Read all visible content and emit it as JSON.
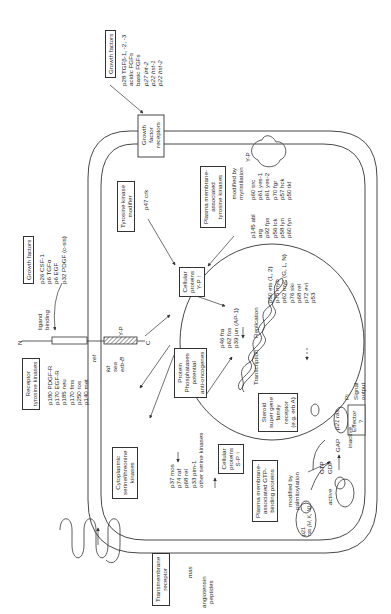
{
  "diagram": {
    "orientation": "rotated-90-ccw",
    "growth_factors_top": {
      "title": "Growth factors",
      "items": [
        "p28 TGFβ-1, -2, -3",
        "acidic FGFs",
        "basic FGFs",
        "p27 int-2",
        "p22 hst-1",
        "p22 hst-2"
      ]
    },
    "growth_factor_receptors": {
      "label_lines": [
        "Growth",
        "factor",
        "receptors"
      ]
    },
    "tyrosine_kinase_modifier": {
      "label_lines": [
        "Tyrosine kinase",
        "modifier"
      ],
      "item": "p47 crk"
    },
    "pm_tyrosine_kinases": {
      "label_lines": [
        "Plasma membrane-",
        "associated",
        "tyrosine kinases"
      ],
      "note_lines": [
        "modified by",
        "myristilation"
      ],
      "col1": [
        "p145 abl",
        "arg",
        "",
        "p92 fps",
        "p56 lck",
        "p58 lyn",
        "p60 fyn"
      ],
      "col2": [
        "p60 src",
        "p61 yes-1",
        "p61 yes-2",
        "p70 fgr",
        "p57 hck",
        "p50 tkl"
      ],
      "phospho": "Y-P"
    },
    "growth_factors_left": {
      "title": "Growth factors",
      "binding_lines": [
        "ligand",
        "binding"
      ],
      "items": [
        "p26 CSF-1",
        "p6 TGFα",
        "p6 EGF",
        "p32 PDGF (c-sis)"
      ]
    },
    "receptor_tyrosine_kinases": {
      "label_lines": [
        "Receptor",
        "tyrosine kinases"
      ],
      "items": [
        "p180 PDGF-R",
        "p170 EGF-R",
        "p185 neu",
        "p170 fms",
        "p250 ros",
        "p140 met"
      ],
      "extra_top": "ret",
      "extra": [
        "kit",
        "sea",
        "erb-B"
      ],
      "n_term": "N",
      "c_term": "C",
      "phospho": "Y-P"
    },
    "cellular_proteins_y": {
      "label_lines": [
        "Cellular",
        "proteins",
        "Y-P ↑"
      ]
    },
    "protein_phosphatases": {
      "label_lines": [
        "Protein",
        "Phosphatases",
        "potential",
        "anti-oncogenes"
      ]
    },
    "nucleus": {
      "ap1": [
        "p46 fra",
        "p62 fos",
        "p39 jun (AP-1)"
      ],
      "transcription": "Transcription",
      "replication": "Replication",
      "nuclear_oncogenes": [
        "p50 ets (1, 2)",
        "p75 myb",
        "p62 myc (G, L, N)",
        "p76 ski",
        "p68 rel",
        "p72 evi",
        "p53"
      ],
      "steroid_receptor": [
        "Steroid",
        "super gene",
        "family",
        "receptor",
        "(e.g. erb A)"
      ]
    },
    "cytoplasmic_kinases": {
      "label_lines": [
        "Cytoplasmic",
        "serine/threonine",
        "kinases"
      ],
      "items": [
        "p37 mos",
        "p74 raf",
        "p68 rel",
        "p33 pim-1",
        "other serine kinases"
      ]
    },
    "cellular_proteins_s": {
      "label_lines": [
        "Cellular",
        "proteins",
        "S-P ↑"
      ]
    },
    "gtp_binding": {
      "label_lines": [
        "Plasma membrane-",
        "associated GTP-",
        "binding proteins"
      ],
      "note_lines": [
        "modified by",
        "palmitoylation"
      ],
      "ras_active": [
        "p21",
        "ras (H, K, N)"
      ],
      "gtp": "GTP",
      "gdp": "GDP",
      "gap": "GAP",
      "active": "active",
      "inactive": "inactive",
      "p21ras": "p21 ras",
      "pi": "Pi",
      "effector": [
        "Effector",
        "?"
      ],
      "signal_output": [
        "Signal",
        "output"
      ]
    },
    "transmembrane_receptor": {
      "label_lines": [
        "Transmembrane",
        "receptor"
      ],
      "item": "mas",
      "ligand_lines": [
        "angiotensin",
        "peptides"
      ]
    }
  }
}
